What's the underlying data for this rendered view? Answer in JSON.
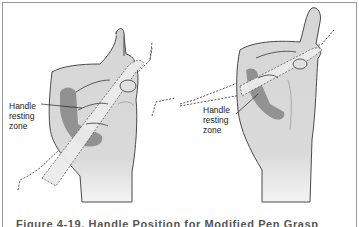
{
  "figure": {
    "left_panel": {
      "label": [
        "Handle",
        "resting",
        "zone"
      ]
    },
    "right_panel": {
      "label": [
        "Handle",
        "resting",
        "zone"
      ]
    },
    "caption": "Figure 4-19. Handle Position for Modified Pen Grasp"
  },
  "colors": {
    "skin_fill": "#d6d6d6",
    "skin_outline": "#4a4a4a",
    "resting_zone": "#8a8a8a",
    "handle_fill": "#ececec",
    "dashed_line": "#555555",
    "border": "#9a9a9a"
  }
}
